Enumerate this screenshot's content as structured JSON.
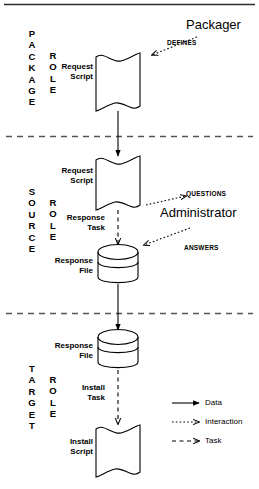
{
  "diagram": {
    "stroke_color": "#000000",
    "background_color": "#ffffff",
    "lanes": [
      {
        "id": "package",
        "name_lines": "P\nA\nC\nK\nA\nG\nE",
        "role_lines": "R\nO\nL\nE"
      },
      {
        "id": "source",
        "name_lines": "S\nO\nU\nR\nC\nE",
        "role_lines": "R\nO\nL\nE"
      },
      {
        "id": "target",
        "name_lines": "T\nA\nR\nG\nE\nT",
        "role_lines": "R\nO\nL\nE"
      }
    ],
    "nodes": [
      {
        "id": "package-request-script",
        "label": "Request\nScript",
        "shape": "script"
      },
      {
        "id": "source-request-script",
        "label": "Request\nScript",
        "shape": "script"
      },
      {
        "id": "source-response-file",
        "label": "Response\nFile",
        "shape": "cylinder"
      },
      {
        "id": "target-response-file",
        "label": "Response\nFile",
        "shape": "cylinder"
      },
      {
        "id": "target-install-script",
        "label": "Install\nScript",
        "shape": "script"
      }
    ],
    "actors": [
      {
        "id": "packager",
        "label": "Packager"
      },
      {
        "id": "administrator",
        "label": "Administrator"
      }
    ],
    "edge_labels": [
      {
        "id": "defines",
        "label": "DEFINES",
        "type": "interaction"
      },
      {
        "id": "questions",
        "label": "QUESTIONS",
        "type": "interaction"
      },
      {
        "id": "answers",
        "label": "ANSWERS",
        "type": "interaction"
      },
      {
        "id": "response-task",
        "label": "Response\nTask",
        "type": "task"
      },
      {
        "id": "install-task",
        "label": "Install\nTask",
        "type": "task"
      }
    ],
    "legend": {
      "items": [
        {
          "id": "data",
          "label": "Data",
          "line_style": "solid"
        },
        {
          "id": "interaction",
          "label": "Interaction",
          "line_style": "dotted"
        },
        {
          "id": "task",
          "label": "Task",
          "line_style": "dashed"
        }
      ]
    }
  }
}
